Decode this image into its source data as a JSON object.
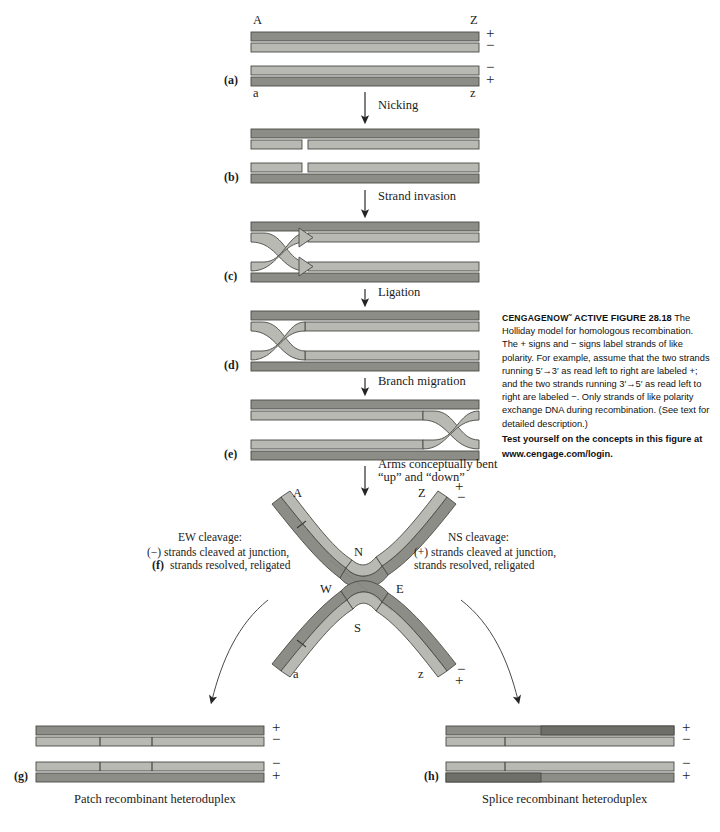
{
  "figure": {
    "top_ends": {
      "left": "A",
      "right": "Z"
    },
    "bottom_ends": {
      "left": "a",
      "right": "z"
    },
    "signs": {
      "plus": "+",
      "minus": "−"
    },
    "panels": [
      {
        "id": "(a)",
        "label": "a"
      },
      {
        "id": "(b)",
        "label": "b"
      },
      {
        "id": "(c)",
        "label": "c"
      },
      {
        "id": "(d)",
        "label": "d"
      },
      {
        "id": "(e)",
        "label": "e"
      },
      {
        "id": "(f)",
        "label": "f"
      },
      {
        "id": "(g)",
        "label": "g"
      },
      {
        "id": "(h)",
        "label": "h"
      }
    ],
    "steps": [
      {
        "name": "nicking",
        "text": "Nicking"
      },
      {
        "name": "strand-invasion",
        "text": "Strand invasion"
      },
      {
        "name": "ligation",
        "text": "Ligation"
      },
      {
        "name": "branch-migration",
        "text": "Branch migration"
      }
    ],
    "bend_note": {
      "line1": "Arms conceptually bent",
      "line2": "“up” and “down”"
    },
    "compass": {
      "n": "N",
      "s": "S",
      "e": "E",
      "w": "W"
    },
    "ew_cleavage": {
      "title": "EW cleavage:",
      "line1": "(−)  strands cleaved at junction,",
      "line2": "strands resolved, religated"
    },
    "ns_cleavage": {
      "title": "NS cleavage:",
      "line1": "(+) strands cleaved at junction,",
      "line2": "strands resolved, religated"
    },
    "results": {
      "patch": "Patch recombinant heteroduplex",
      "splice": "Splice recombinant heteroduplex"
    },
    "colors": {
      "plus_strand": "#8d8d87",
      "minus_strand": "#b9b9b3",
      "plus_strand_dark": "#6f6f69",
      "outline": "#4a4a45",
      "arrow": "#2a2a2a"
    }
  },
  "caption": {
    "brand": "CENGAGENOW˜",
    "active_figure": "ACTIVE FIGURE 28.18",
    "body": "The Holliday model for homologous recombination. The + signs and − signs label strands of like polarity. For example, assume that the two strands running 5′→3′ as read left to right are labeled +; and the two strands running 3′→5′ as read left to right are labeled −. Only strands of like polarity exchange DNA during recombination. (See text for detailed description.)",
    "test_line1": "Test yourself on the concepts in this figure at",
    "test_line2": "www.cengage.com/login."
  }
}
